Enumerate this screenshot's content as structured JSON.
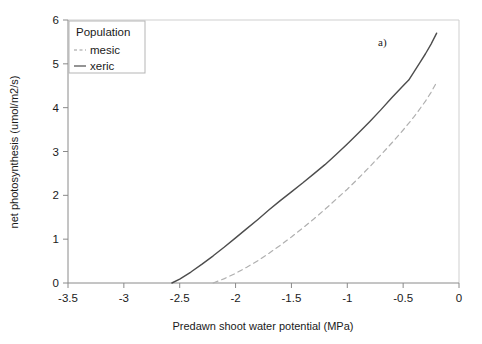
{
  "chart_data": {
    "type": "line",
    "title": "",
    "panel_label": "a)",
    "xlabel": "Predawn shoot water potential   (MPa)",
    "ylabel": "net photosynthesis (umol/m2/s)",
    "xlim": [
      -3.5,
      0
    ],
    "ylim": [
      0,
      6
    ],
    "xticks": [
      -3.5,
      -3,
      -2.5,
      -2,
      -1.5,
      -1,
      -0.5,
      0
    ],
    "xtick_labels": [
      "-3.5",
      "-3",
      "-2.5",
      "-2",
      "-1.5",
      "-1",
      "-0.5",
      "0"
    ],
    "yticks": [
      0,
      1,
      2,
      3,
      4,
      5,
      6
    ],
    "ytick_labels": [
      "0",
      "1",
      "2",
      "3",
      "4",
      "5",
      "6"
    ],
    "grid": false,
    "legend": {
      "title": "Population",
      "position": "top-left-inside",
      "entries": [
        {
          "name": "mesic",
          "style": "dashed",
          "color": "#9a9a9a"
        },
        {
          "name": "xeric",
          "style": "solid",
          "color": "#5a5a5a"
        }
      ]
    },
    "series": [
      {
        "name": "xeric",
        "style": "solid",
        "color": "#4d4d4d",
        "points": [
          {
            "x": -2.57,
            "y": 0.0
          },
          {
            "x": -2.5,
            "y": 0.09
          },
          {
            "x": -2.4,
            "y": 0.25
          },
          {
            "x": -2.3,
            "y": 0.43
          },
          {
            "x": -2.2,
            "y": 0.62
          },
          {
            "x": -2.1,
            "y": 0.82
          },
          {
            "x": -2.0,
            "y": 1.03
          },
          {
            "x": -1.9,
            "y": 1.24
          },
          {
            "x": -1.8,
            "y": 1.45
          },
          {
            "x": -1.7,
            "y": 1.67
          },
          {
            "x": -1.6,
            "y": 1.88
          },
          {
            "x": -1.5,
            "y": 2.08
          },
          {
            "x": -1.4,
            "y": 2.28
          },
          {
            "x": -1.3,
            "y": 2.49
          },
          {
            "x": -1.2,
            "y": 2.7
          },
          {
            "x": -1.1,
            "y": 2.93
          },
          {
            "x": -1.0,
            "y": 3.17
          },
          {
            "x": -0.9,
            "y": 3.42
          },
          {
            "x": -0.8,
            "y": 3.68
          },
          {
            "x": -0.7,
            "y": 3.95
          },
          {
            "x": -0.6,
            "y": 4.23
          },
          {
            "x": -0.5,
            "y": 4.5
          },
          {
            "x": -0.45,
            "y": 4.63
          },
          {
            "x": -0.4,
            "y": 4.83
          },
          {
            "x": -0.35,
            "y": 5.03
          },
          {
            "x": -0.3,
            "y": 5.23
          },
          {
            "x": -0.25,
            "y": 5.45
          },
          {
            "x": -0.2,
            "y": 5.7
          }
        ]
      },
      {
        "name": "mesic",
        "style": "dashed",
        "color": "#b0b0b0",
        "points": [
          {
            "x": -2.2,
            "y": 0.0
          },
          {
            "x": -2.1,
            "y": 0.1
          },
          {
            "x": -2.0,
            "y": 0.22
          },
          {
            "x": -1.9,
            "y": 0.36
          },
          {
            "x": -1.8,
            "y": 0.51
          },
          {
            "x": -1.7,
            "y": 0.68
          },
          {
            "x": -1.6,
            "y": 0.86
          },
          {
            "x": -1.5,
            "y": 1.05
          },
          {
            "x": -1.4,
            "y": 1.25
          },
          {
            "x": -1.3,
            "y": 1.46
          },
          {
            "x": -1.2,
            "y": 1.68
          },
          {
            "x": -1.1,
            "y": 1.91
          },
          {
            "x": -1.0,
            "y": 2.14
          },
          {
            "x": -0.9,
            "y": 2.39
          },
          {
            "x": -0.8,
            "y": 2.65
          },
          {
            "x": -0.7,
            "y": 2.92
          },
          {
            "x": -0.6,
            "y": 3.2
          },
          {
            "x": -0.5,
            "y": 3.49
          },
          {
            "x": -0.4,
            "y": 3.8
          },
          {
            "x": -0.3,
            "y": 4.15
          },
          {
            "x": -0.25,
            "y": 4.35
          },
          {
            "x": -0.2,
            "y": 4.58
          }
        ]
      }
    ]
  }
}
